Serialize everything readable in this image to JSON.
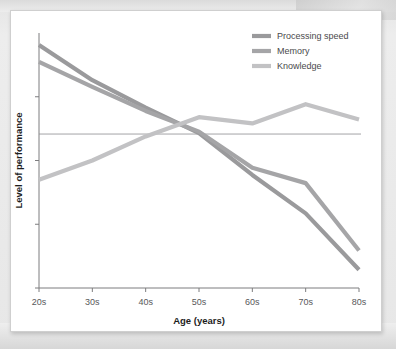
{
  "figure": {
    "background_color": "#ffffff",
    "page_background_color": "#e9e9e9"
  },
  "chart_data": {
    "type": "line",
    "title": "",
    "xlabel": "Age (years)",
    "ylabel": "Level of performance",
    "categories": [
      "20s",
      "30s",
      "40s",
      "50s",
      "60s",
      "70s",
      "80s"
    ],
    "x": [
      20,
      30,
      40,
      50,
      60,
      70,
      80
    ],
    "grid": false,
    "reference_line_y": 0,
    "legend_position": "top-right",
    "ylim": [
      -3.2,
      2.1
    ],
    "yticks_labeled": false,
    "series": [
      {
        "name": "Processing speed",
        "color": "#9a9a9c",
        "values": [
          1.85,
          1.12,
          0.55,
          0.02,
          -0.85,
          -1.65,
          -2.82
        ]
      },
      {
        "name": "Memory",
        "color": "#a5a5a7",
        "values": [
          1.5,
          0.98,
          0.48,
          0.05,
          -0.7,
          -1.02,
          -2.42
        ]
      },
      {
        "name": "Knowledge",
        "color": "#c2c2c4",
        "values": [
          -0.95,
          -0.55,
          -0.05,
          0.35,
          0.22,
          0.62,
          0.3
        ]
      }
    ]
  },
  "legend": {
    "items": [
      {
        "label": "Processing speed",
        "color": "#9a9a9c"
      },
      {
        "label": "Memory",
        "color": "#a5a5a7"
      },
      {
        "label": "Knowledge",
        "color": "#c2c2c4"
      }
    ]
  },
  "axes": {
    "x_tick_labels": [
      "20s",
      "30s",
      "40s",
      "50s",
      "60s",
      "70s",
      "80s"
    ],
    "x_axis_title": "Age (years)",
    "y_axis_title": "Level of performance",
    "y_tick_count": 4
  }
}
